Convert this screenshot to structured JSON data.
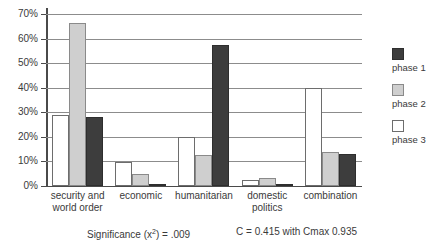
{
  "chart_data": {
    "type": "bar",
    "title": "",
    "xlabel": "",
    "ylabel": "",
    "ylim": [
      0,
      70
    ],
    "grid": true,
    "legend_position": "right",
    "categories": [
      "security and world order",
      "economic",
      "humanitarian",
      "domestic politics",
      "combination"
    ],
    "ytick_labels": [
      "70%",
      "60%",
      "50%",
      "40%",
      "30%",
      "20%",
      "10%",
      "0%"
    ],
    "ytick_values": [
      70,
      60,
      50,
      40,
      30,
      20,
      10,
      0
    ],
    "series": [
      {
        "name": "phase 3",
        "style": "white",
        "values": [
          29,
          9.8,
          20,
          2.3,
          40
        ]
      },
      {
        "name": "phase 2",
        "style": "gray",
        "values": [
          66.5,
          4.8,
          12.5,
          3.4,
          14
        ]
      },
      {
        "name": "phase 1",
        "style": "dark",
        "values": [
          28,
          0.6,
          57.5,
          0.6,
          13
        ]
      }
    ],
    "legend_order": [
      "phase 1",
      "phase 2",
      "phase 3"
    ],
    "annotations": [
      "Significance (x²) = .009",
      "C = 0.415 with Cmax 0.935"
    ]
  },
  "legend": {
    "items": [
      {
        "label": "phase 1",
        "style": "dark",
        "color": "#3d3d3d"
      },
      {
        "label": "phase 2",
        "style": "gray",
        "color": "#cfcfcf"
      },
      {
        "label": "phase 3",
        "style": "white",
        "color": "#ffffff"
      }
    ]
  },
  "footer": {
    "significance_prefix": "Significance (x",
    "significance_sup": "2",
    "significance_suffix": ") = .009",
    "contingency": "C = 0.415 with Cmax 0.935"
  },
  "xlabels": [
    {
      "line1": "security and",
      "line2": "world order"
    },
    {
      "line1": "economic",
      "line2": ""
    },
    {
      "line1": "humanitarian",
      "line2": ""
    },
    {
      "line1": "domestic",
      "line2": "politics"
    },
    {
      "line1": "combination",
      "line2": ""
    }
  ]
}
